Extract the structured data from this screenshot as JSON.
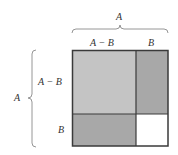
{
  "diagram": {
    "type": "area-model-square",
    "top_brace_label": "A",
    "left_brace_label": "A",
    "top_segment_labels": [
      "A − B",
      "B"
    ],
    "left_segment_labels": [
      "A − B",
      "B"
    ],
    "regions": [
      {
        "name": "top-left",
        "size": "(A − B) × (A − B)",
        "fill": "#c4c4c4"
      },
      {
        "name": "top-right",
        "size": "B × (A − B)",
        "fill": "#a8a8a8"
      },
      {
        "name": "bottom-left",
        "size": "(A − B) × B",
        "fill": "#a8a8a8"
      },
      {
        "name": "bottom-right",
        "size": "B × B",
        "fill": "#ffffff"
      }
    ],
    "colors": {
      "border": "#3a3a3a",
      "brace": "#8a8a8a",
      "text": "#333333"
    }
  }
}
